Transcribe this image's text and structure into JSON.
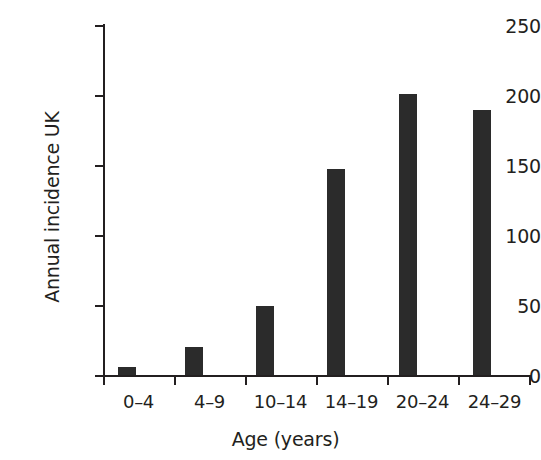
{
  "chart_data": {
    "type": "bar",
    "title": "",
    "subtitle": "",
    "xlabel": "Age (years)",
    "ylabel": "Annual incidence UK",
    "categories": [
      "0–4",
      "4–9",
      "10–14",
      "14–19",
      "20–24",
      "24–29"
    ],
    "values": [
      6,
      20,
      49,
      147,
      201,
      189
    ],
    "series": [
      {
        "name": "Annual incidence UK",
        "values": [
          6,
          20,
          49,
          147,
          201,
          189
        ]
      }
    ],
    "ylim": [
      0,
      250
    ],
    "ytick_labels": [
      "0",
      "50",
      "100",
      "150",
      "200",
      "250"
    ],
    "ytick_values": [
      0,
      50,
      100,
      150,
      200,
      250
    ],
    "grid": false,
    "legend": null,
    "legend_position": "none",
    "annotations": [],
    "colors": {
      "bar": "#2b2b2b",
      "axis": "#231f20",
      "text": "#231f20",
      "background": "#ffffff"
    }
  }
}
